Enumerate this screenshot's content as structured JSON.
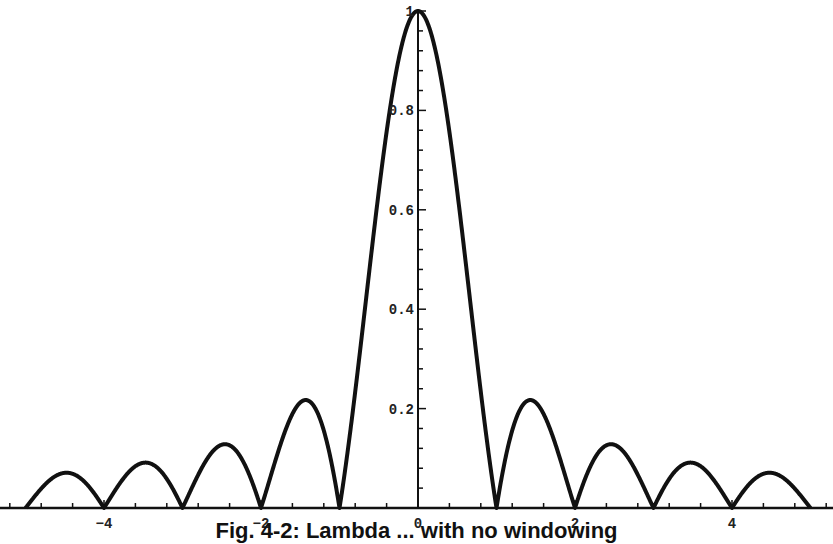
{
  "chart_data": {
    "type": "line",
    "title": "",
    "caption": "Fig. 4-2: Lambda ... with no windowing",
    "function": "|sin(pi x)/(pi x)|",
    "xlabel": "",
    "ylabel": "",
    "xlim": [
      -5.2,
      5.3
    ],
    "ylim": [
      0,
      1
    ],
    "x_ticks": [
      -4,
      -2,
      0,
      2,
      4
    ],
    "x_tick_labels": [
      "-4",
      "-2",
      "0",
      "2",
      "4"
    ],
    "y_ticks": [
      0.2,
      0.4,
      0.6,
      0.8,
      1
    ],
    "y_tick_labels": [
      "0.2",
      "0.4",
      "0.6",
      "0.8",
      "1"
    ],
    "grid": false,
    "legend": null,
    "series": [
      {
        "name": "|sinc(x)|",
        "x": [
          -5,
          -4.5,
          -4,
          -3.5,
          -3,
          -2.5,
          -2,
          -1.5,
          -1,
          -0.5,
          0,
          0.5,
          1,
          1.5,
          2,
          2.5,
          3,
          3.5,
          4,
          4.5,
          5
        ],
        "values": [
          0,
          0.071,
          0,
          0.091,
          0,
          0.127,
          0,
          0.212,
          0,
          0.637,
          1,
          0.637,
          0,
          0.212,
          0,
          0.127,
          0,
          0.091,
          0,
          0.071,
          0
        ]
      }
    ],
    "line_color": "#111111"
  },
  "axes": {
    "x_labels": [
      "-4",
      "-2",
      "0",
      "2",
      "4"
    ],
    "y_labels": [
      "0.2",
      "0.4",
      "0.6",
      "0.8",
      "1"
    ]
  },
  "caption": "Fig. 4-2: Lambda ... with no windowing"
}
